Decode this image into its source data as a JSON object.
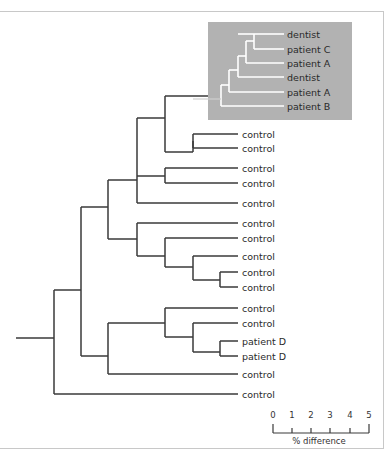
{
  "figure": {
    "type": "phylogenetic-tree",
    "inset": {
      "background": "#b2b2b2",
      "branch_color": "#ffffff",
      "leaves": [
        "dentist",
        "patient C",
        "patient A",
        "dentist",
        "patient A",
        "patient B"
      ]
    },
    "main_leaves": [
      "control",
      "control",
      "control",
      "control",
      "control",
      "control",
      "control",
      "control",
      "control",
      "control",
      "control",
      "control",
      "patient D",
      "patient D",
      "control",
      "control"
    ],
    "branch_color": "#3a3a3a",
    "scale_bar": {
      "ticks": [
        "0",
        "1",
        "2",
        "3",
        "4",
        "5"
      ],
      "label": "% difference"
    }
  }
}
